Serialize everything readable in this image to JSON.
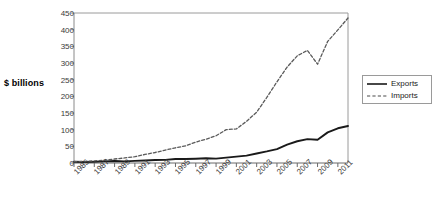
{
  "chart_data": {
    "type": "line",
    "title": "",
    "subtitle": "",
    "xlabel": "",
    "ylabel": "$ billions",
    "ylim": [
      0,
      450
    ],
    "xlim": [
      1985,
      2012
    ],
    "ytick_values": [
      0,
      50,
      100,
      150,
      200,
      250,
      300,
      350,
      400,
      450
    ],
    "ytick_labels": [
      "0",
      "50",
      "100",
      "150",
      "200",
      "250",
      "300",
      "350",
      "400",
      "450"
    ],
    "xtick_labels": [
      "1985",
      "1987",
      "1989",
      "1991",
      "1993",
      "1995",
      "1997",
      "1999",
      "2001",
      "2003",
      "2005",
      "2007",
      "2009",
      "2011"
    ],
    "xtick_values": [
      1985,
      1987,
      1989,
      1991,
      1993,
      1995,
      1997,
      1999,
      2001,
      2003,
      2005,
      2007,
      2009,
      2011
    ],
    "grid": false,
    "legend_position": "right",
    "x": [
      1985,
      1986,
      1987,
      1988,
      1989,
      1990,
      1991,
      1992,
      1993,
      1994,
      1995,
      1996,
      1997,
      1998,
      1999,
      2000,
      2001,
      2002,
      2003,
      2004,
      2005,
      2006,
      2007,
      2008,
      2009,
      2010,
      2011,
      2012
    ],
    "series": [
      {
        "name": "Exports",
        "style": "solid",
        "color": "#1a1a1a",
        "values": [
          3.9,
          3.1,
          3.5,
          5.0,
          5.8,
          4.8,
          6.3,
          7.5,
          8.8,
          9.3,
          11.8,
          12.0,
          12.9,
          14.3,
          13.1,
          16.3,
          19.2,
          22.1,
          28.4,
          34.7,
          41.8,
          55.2,
          65.2,
          71.5,
          69.6,
          91.9,
          104.1,
          111.0
        ]
      },
      {
        "name": "Imports",
        "style": "dashed",
        "color": "#5a5a5a",
        "values": [
          3.9,
          4.8,
          6.3,
          8.5,
          12.0,
          15.2,
          19.0,
          25.7,
          31.5,
          38.8,
          45.6,
          51.5,
          62.6,
          71.2,
          81.8,
          100.0,
          102.3,
          125.2,
          152.4,
          196.7,
          243.5,
          287.8,
          321.5,
          337.8,
          296.4,
          364.9,
          399.3,
          435.0
        ]
      }
    ]
  },
  "legend": {
    "items": [
      {
        "label": "Exports"
      },
      {
        "label": "Imports"
      }
    ]
  },
  "colors": {
    "exports": "#1a1a1a",
    "imports": "#5a5a5a",
    "axis": "#8a8a8a",
    "text": "#3a3a3a"
  }
}
